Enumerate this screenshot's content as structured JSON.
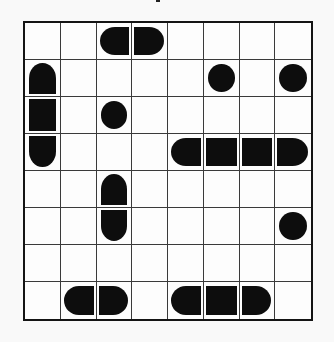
{
  "puzzle": {
    "type": "battleship",
    "rows": 8,
    "cols": 8,
    "colors": {
      "ship": "#0d0d0d",
      "grid_line": "#3a3a3a",
      "border": "#141414",
      "background": "#fdfdfd"
    },
    "cells": [
      [
        "",
        "",
        "left",
        "right",
        "",
        "",
        "",
        ""
      ],
      [
        "top",
        "",
        "",
        "",
        "",
        "sub",
        "",
        "sub"
      ],
      [
        "vmid",
        "",
        "sub",
        "",
        "",
        "",
        "",
        ""
      ],
      [
        "bottom",
        "",
        "",
        "",
        "left",
        "hmid",
        "hmid",
        "right"
      ],
      [
        "",
        "",
        "top",
        "",
        "",
        "",
        "",
        ""
      ],
      [
        "",
        "",
        "bottom",
        "",
        "",
        "",
        "",
        "sub"
      ],
      [
        "",
        "",
        "",
        "",
        "",
        "",
        "",
        ""
      ],
      [
        "",
        "left",
        "right",
        "",
        "left",
        "hmid",
        "right",
        ""
      ]
    ]
  }
}
